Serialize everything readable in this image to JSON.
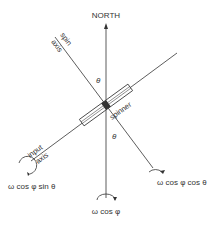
{
  "diagram": {
    "north_label": "NORTH",
    "spin_axis_label_line1": "spin",
    "spin_axis_label_line2": "axis",
    "input_axis_label_line1": "input",
    "input_axis_label_line2": "axis",
    "spinner_label": "spinner",
    "theta_upper": "θ",
    "theta_lower": "θ",
    "component_input": "ω cos φ sin θ",
    "component_vertical": "ω cos φ",
    "component_spin": "ω cos φ cos θ",
    "line_color": "#333333"
  }
}
